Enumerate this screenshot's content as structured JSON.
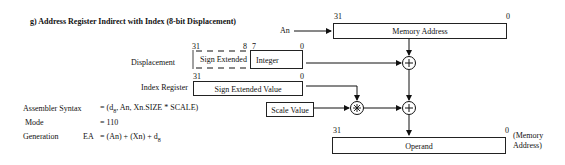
{
  "title": "g) Address Register Indirect with Index  (8-bit Displacement)",
  "an_label": "An",
  "memory_address": {
    "label": "Memory Address",
    "bit_high": "31",
    "bit_low": "0"
  },
  "displacement": {
    "label": "Displacement",
    "bit_high": "31",
    "bit_mid_high": "8",
    "bit_mid_low": "7",
    "bit_low": "0",
    "left_field": "Sign Extended",
    "right_field": "Integer"
  },
  "index_register": {
    "label": "Index Register",
    "value": "Sign Extended Value",
    "bit_high": "31",
    "bit_low": "0"
  },
  "scale_value": {
    "label": "Scale Value"
  },
  "operand": {
    "label": "Operand",
    "bit_high": "31",
    "bit_low": "0",
    "note_line1": "(Memory",
    "note_line2": "Address)"
  },
  "info": {
    "assembler_syntax_label": "Assembler  Syntax",
    "assembler_syntax_prefix": "= (d",
    "assembler_syntax_sub": "8",
    "assembler_syntax_suffix": ", An, Xn.SIZE * SCALE)",
    "mode_label": "Mode",
    "mode_value": "= 110",
    "generation_label": "Generation",
    "generation_ea": "EA",
    "generation_value_prefix": "= (An) + (Xn) + d",
    "generation_value_sub": "8"
  },
  "operators": {
    "add": "+",
    "multiply": "*"
  }
}
